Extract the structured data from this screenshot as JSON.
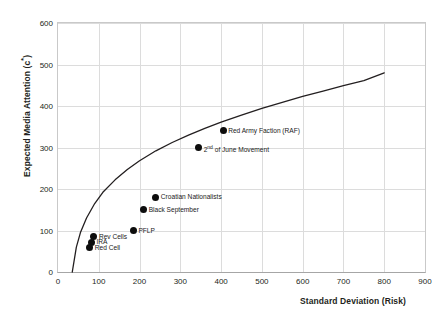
{
  "chart_data": {
    "type": "scatter",
    "title": "",
    "xlabel": "Standard Deviation (Risk)",
    "ylabel": "Expected Media Attention (c*)",
    "ylabel_base": "Expected Media Attention (c",
    "ylabel_sup": "*",
    "ylabel_close": ")",
    "xlim": [
      0,
      900
    ],
    "ylim": [
      0,
      600
    ],
    "xticks": [
      "0",
      "100",
      "200",
      "300",
      "400",
      "500",
      "600",
      "700",
      "800",
      "900"
    ],
    "xtick_values": [
      0,
      100,
      200,
      300,
      400,
      500,
      600,
      700,
      800,
      900
    ],
    "yticks": [
      "0",
      "100",
      "200",
      "300",
      "400",
      "500",
      "600"
    ],
    "ytick_values": [
      0,
      100,
      200,
      300,
      400,
      500,
      600
    ],
    "grid": true,
    "legend": "none",
    "marker_color": "#0d0d0d",
    "curve_color": "#231f20",
    "grid_color": "#dcdcdc",
    "frontier_curve": {
      "name": "efficient frontier",
      "points": [
        [
          35,
          0
        ],
        [
          45,
          60
        ],
        [
          55,
          95
        ],
        [
          70,
          130
        ],
        [
          90,
          165
        ],
        [
          110,
          192
        ],
        [
          140,
          222
        ],
        [
          170,
          247
        ],
        [
          200,
          268
        ],
        [
          240,
          292
        ],
        [
          280,
          312
        ],
        [
          320,
          330
        ],
        [
          360,
          346
        ],
        [
          400,
          361
        ],
        [
          450,
          378
        ],
        [
          500,
          394
        ],
        [
          550,
          409
        ],
        [
          600,
          423
        ],
        [
          650,
          436
        ],
        [
          700,
          449
        ],
        [
          750,
          461
        ],
        [
          800,
          480
        ]
      ]
    },
    "points": [
      {
        "label": "Red Army Faction (RAF)",
        "x": 405,
        "y": 340,
        "label_pos": "right"
      },
      {
        "label": "2nd of June Movement",
        "x": 345,
        "y": 300,
        "label_pos": "right",
        "label_prefix": "2",
        "label_sup": "nd",
        "label_suffix": " of June Movement"
      },
      {
        "label": "Croatian Nationalists",
        "x": 240,
        "y": 180,
        "label_pos": "right"
      },
      {
        "label": "Black September",
        "x": 210,
        "y": 150,
        "label_pos": "right"
      },
      {
        "label": "PFLP",
        "x": 185,
        "y": 100,
        "label_pos": "right"
      },
      {
        "label": "Rev Cells",
        "x": 88,
        "y": 85,
        "label_pos": "right"
      },
      {
        "label": "IRA",
        "x": 82,
        "y": 72,
        "label_pos": "right"
      },
      {
        "label": "Red Cell",
        "x": 78,
        "y": 58,
        "label_pos": "right"
      }
    ]
  }
}
